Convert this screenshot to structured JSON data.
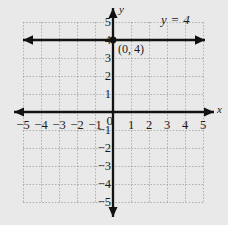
{
  "figure": {
    "kind": "coordinate-plane-graph",
    "background_color": "#e9e9e9",
    "grid_color": "#8d8d8d",
    "axis_color": "#121212"
  },
  "labels": {
    "y_axis_name": "y",
    "x_axis_name": "x",
    "equation": "y = 4",
    "point_label": "(0, 4)"
  },
  "chart_data": {
    "type": "line",
    "title": "",
    "subtitle": "",
    "xlabel": "x",
    "ylabel": "y",
    "xlim": [
      -5,
      5
    ],
    "ylim": [
      -5,
      5
    ],
    "grid": true,
    "legend": "none",
    "x_ticks": [
      -5,
      -4,
      -3,
      -2,
      -1,
      0,
      1,
      2,
      3,
      4,
      5
    ],
    "y_ticks": [
      -5,
      -4,
      -3,
      -2,
      -1,
      0,
      1,
      2,
      3,
      4,
      5
    ],
    "x_tick_labels": [
      "-5",
      "-4",
      "-3",
      "-2",
      "-1",
      "0",
      "1",
      "2",
      "3",
      "4",
      "5"
    ],
    "y_tick_labels": [
      "-5",
      "-4",
      "-3",
      "-2",
      "-1",
      "0",
      "1",
      "2",
      "3",
      "4",
      "5"
    ],
    "origin_label": "0",
    "series": [
      {
        "name": "y = 4",
        "equation": "y = 4",
        "kind": "horizontal-line",
        "slope": 0,
        "intercept": 4,
        "arrows": "both",
        "x": [
          -5,
          5
        ],
        "values": [
          4,
          4
        ],
        "annotation": "y = 4"
      }
    ],
    "points": [
      {
        "label": "(0, 4)",
        "x": 0,
        "y": 4,
        "marker": "filled-circle"
      }
    ],
    "annotations": [
      {
        "text": "y = 4",
        "x": 3.1,
        "y": 4.85
      },
      {
        "text": "(0, 4)",
        "x": 0.45,
        "y": 3.45
      }
    ]
  },
  "ticks": {
    "x_negative": [
      "-5",
      "-4",
      "-3",
      "-2",
      "-1"
    ],
    "x_origin": "0",
    "x_positive": [
      "1",
      "2",
      "3",
      "4",
      "5"
    ],
    "y_positive": [
      "5",
      "4",
      "3",
      "2",
      "1"
    ],
    "y_negative": [
      "-1",
      "-2",
      "-3",
      "-4",
      "-5"
    ]
  }
}
